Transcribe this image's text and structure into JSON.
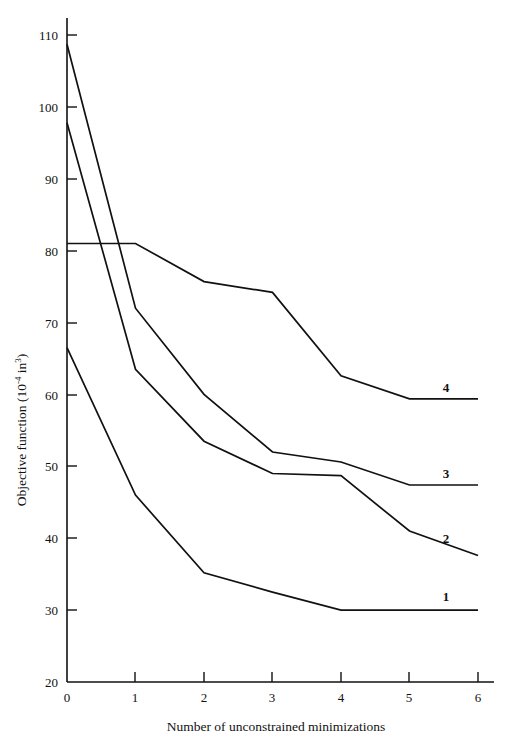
{
  "chart_data": {
    "type": "line",
    "title": "",
    "xlabel": "Number of unconstrained minimizations",
    "ylabel": "Objective function (10⁻⁴ in³)",
    "ylabel_parts": {
      "main": "Objective function (10",
      "exponent": "-4",
      "middle": " in",
      "exponent2": "3",
      "close": ")"
    },
    "x": [
      0,
      1,
      2,
      3,
      4,
      5,
      6
    ],
    "xticklabels": [
      "0",
      "1",
      "2",
      "3",
      "4",
      "5",
      "6"
    ],
    "yticks": [
      20,
      30,
      40,
      50,
      60,
      70,
      80,
      90,
      100,
      110
    ],
    "yticklabels": [
      "20",
      "30",
      "40",
      "50",
      "60",
      "70",
      "80",
      "90",
      "100",
      "110"
    ],
    "xlim": [
      0,
      6
    ],
    "ylim": [
      20,
      110
    ],
    "grid": false,
    "legend_position": "inline-right-end-labels",
    "series": [
      {
        "name": "1",
        "label": "1",
        "color": "#111111",
        "x": [
          0,
          1,
          2,
          3,
          4,
          5,
          6
        ],
        "values": [
          66.5,
          46.0,
          35.2,
          32.5,
          30.0,
          30.0,
          30.0
        ]
      },
      {
        "name": "2",
        "label": "2",
        "color": "#111111",
        "x": [
          0,
          1,
          2,
          3,
          4,
          5,
          6
        ],
        "values": [
          97.8,
          63.5,
          53.5,
          49.0,
          48.7,
          41.0,
          37.6
        ]
      },
      {
        "name": "3",
        "label": "3",
        "color": "#111111",
        "x": [
          0,
          1,
          2,
          3,
          4,
          5,
          6
        ],
        "values": [
          108.7,
          72.0,
          60.0,
          52.0,
          50.6,
          47.4,
          47.4
        ]
      },
      {
        "name": "4",
        "label": "4",
        "color": "#111111",
        "x": [
          0,
          1,
          2,
          3,
          4,
          5,
          6
        ],
        "values": [
          81.0,
          81.0,
          75.7,
          74.2,
          62.6,
          59.4,
          59.4
        ]
      }
    ],
    "axes_geometry": {
      "x0_px": 67,
      "x6_px": 478,
      "y20_px": 682,
      "y110_px": 35
    }
  },
  "series_labels": {
    "s4": "4",
    "s3": "3",
    "s2": "2",
    "s1": "1"
  },
  "axis": {
    "x_title": "Number of unconstrained minimizations",
    "y_title_main": "Objective function (10",
    "y_title_exp": "-4",
    "y_title_mid": " in",
    "y_title_exp2": "3",
    "y_title_close": ")"
  },
  "yticks": {
    "t110": "110",
    "t100": "100",
    "t90": "90",
    "t80": "80",
    "t70": "70",
    "t60": "60",
    "t50": "50",
    "t40": "40",
    "t30": "30",
    "t20": "20"
  },
  "xticks": {
    "t0": "0",
    "t1": "1",
    "t2": "2",
    "t3": "3",
    "t4": "4",
    "t5": "5",
    "t6": "6"
  }
}
